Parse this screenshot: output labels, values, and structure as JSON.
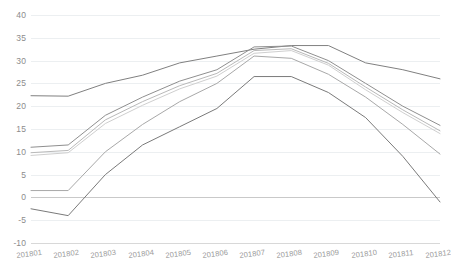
{
  "chart_data": {
    "type": "line",
    "title": "",
    "subtitle": "",
    "xlabel": "",
    "ylabel": "",
    "categories": [
      "201801",
      "201802",
      "201803",
      "201804",
      "201805",
      "201806",
      "201807",
      "201808",
      "201809",
      "201810",
      "201811",
      "201812"
    ],
    "ylim": [
      -10,
      40
    ],
    "yticks": [
      40,
      35,
      30,
      25,
      20,
      15,
      10,
      5,
      0,
      -10
    ],
    "ytick_labels": [
      "40",
      "35",
      "30",
      "25",
      "20",
      "15",
      "10",
      "5",
      "0",
      "-5",
      "-10"
    ],
    "ytick_values": [
      40,
      35,
      30,
      25,
      20,
      15,
      10,
      5,
      0,
      -5,
      -10
    ],
    "grid": true,
    "grid_axis": "y",
    "legend": false,
    "legend_position": "none",
    "series": [
      {
        "name": "series-1",
        "color": "#808080",
        "values": [
          22.3,
          22.2,
          25.0,
          26.8,
          29.5,
          31.0,
          32.5,
          33.3,
          33.3,
          29.5,
          28.0,
          26.0
        ]
      },
      {
        "name": "series-2",
        "color": "#8f8f8f",
        "values": [
          11.0,
          11.5,
          18.0,
          22.0,
          25.5,
          28.0,
          33.0,
          33.2,
          30.0,
          25.0,
          20.0,
          15.8
        ]
      },
      {
        "name": "series-3",
        "color": "#b9b9b9",
        "values": [
          9.8,
          10.3,
          17.0,
          21.0,
          24.5,
          27.2,
          32.2,
          32.6,
          29.4,
          24.2,
          19.2,
          14.6
        ]
      },
      {
        "name": "series-4",
        "color": "#cfcfcf",
        "values": [
          9.2,
          9.8,
          16.2,
          20.2,
          23.8,
          26.6,
          31.6,
          32.2,
          29.0,
          23.6,
          18.6,
          14.0
        ]
      },
      {
        "name": "series-5",
        "color": "#a8a8a8",
        "values": [
          1.5,
          1.5,
          10.0,
          16.0,
          21.0,
          25.0,
          31.0,
          30.5,
          27.0,
          22.0,
          16.0,
          9.5
        ]
      },
      {
        "name": "series-6",
        "color": "#7a7a7a",
        "values": [
          -2.5,
          -4.0,
          5.0,
          11.5,
          15.5,
          19.5,
          26.5,
          26.5,
          23.0,
          17.5,
          9.0,
          -1.0
        ]
      }
    ]
  },
  "axes": {
    "y_axis_name": "value-axis",
    "x_axis_name": "period-axis"
  }
}
